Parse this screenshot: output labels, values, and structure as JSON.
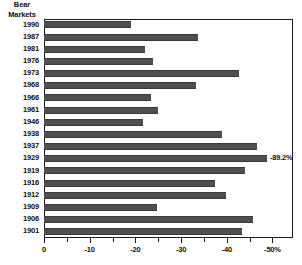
{
  "chart": {
    "corner_label_lines": [
      "Bear",
      "Markets"
    ],
    "axis": {
      "major_ticks": [
        "0",
        "-10",
        "-20",
        "-30",
        "-40",
        "-50%"
      ],
      "major_tick_values": [
        0,
        -10,
        -20,
        -30,
        -40,
        -50
      ],
      "minor_tick_values": [
        -5,
        -15,
        -25,
        -35,
        -45
      ]
    }
  },
  "chart_data": {
    "type": "bar",
    "orientation": "horizontal",
    "title": "Bear Markets",
    "xlabel": "",
    "ylabel": "Bear Markets",
    "xlim": [
      0,
      -54.5
    ],
    "grid": false,
    "legend": null,
    "categories": [
      "1990",
      "1987",
      "1981",
      "1976",
      "1973",
      "1968",
      "1966",
      "1961",
      "1946",
      "1938",
      "1937",
      "1929",
      "1919",
      "1916",
      "1912",
      "1909",
      "1906",
      "1901"
    ],
    "values": [
      -19.0,
      -33.8,
      -22.1,
      -23.9,
      -42.6,
      -33.3,
      -23.5,
      -25.0,
      -21.7,
      -38.9,
      -46.6,
      -48.8,
      -44.0,
      -37.4,
      -39.8,
      -24.7,
      -45.7,
      -43.3
    ],
    "annotations": [
      {
        "category": "1929",
        "text": "-89.2%",
        "actual_value": -89.2
      }
    ],
    "bar_color": "#4f4f4f"
  }
}
